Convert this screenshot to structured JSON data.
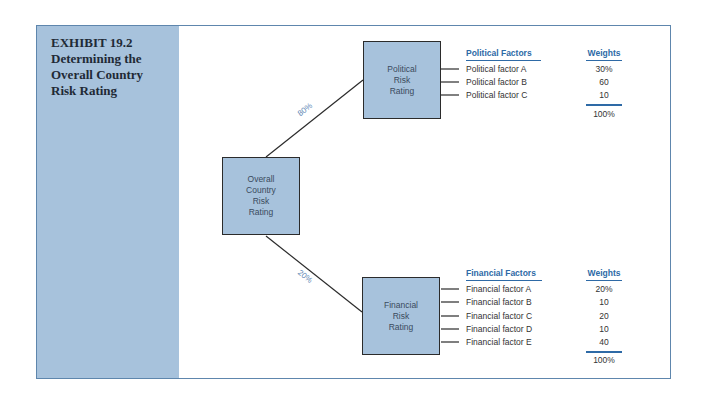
{
  "exhibit": {
    "title_lines": [
      "EXHIBIT 19.2",
      "Determining the",
      "Overall Country",
      "Risk Rating"
    ]
  },
  "boxes": {
    "overall": [
      "Overall",
      "Country",
      "Risk",
      "Rating"
    ],
    "political": [
      "Political",
      "Risk",
      "Rating"
    ],
    "financial": [
      "Financial",
      "Risk",
      "Rating"
    ]
  },
  "branches": {
    "political_weight": "80%",
    "financial_weight": "20%"
  },
  "political": {
    "header_factors": "Political Factors",
    "header_weights": "Weights",
    "factors": [
      {
        "label": "Political factor A",
        "weight": "30%"
      },
      {
        "label": "Political factor B",
        "weight": "60"
      },
      {
        "label": "Political factor C",
        "weight": "10"
      }
    ],
    "total": "100%"
  },
  "financial": {
    "header_factors": "Financial Factors",
    "header_weights": "Weights",
    "factors": [
      {
        "label": "Financial factor A",
        "weight": "20%"
      },
      {
        "label": "Financial factor B",
        "weight": "10"
      },
      {
        "label": "Financial factor C",
        "weight": "20"
      },
      {
        "label": "Financial factor D",
        "weight": "10"
      },
      {
        "label": "Financial factor E",
        "weight": "40"
      }
    ],
    "total": "100%"
  },
  "colors": {
    "panel_fill": "#a7c2dc",
    "header_blue": "#2e6aa6",
    "frame_border": "#5e86ad"
  }
}
